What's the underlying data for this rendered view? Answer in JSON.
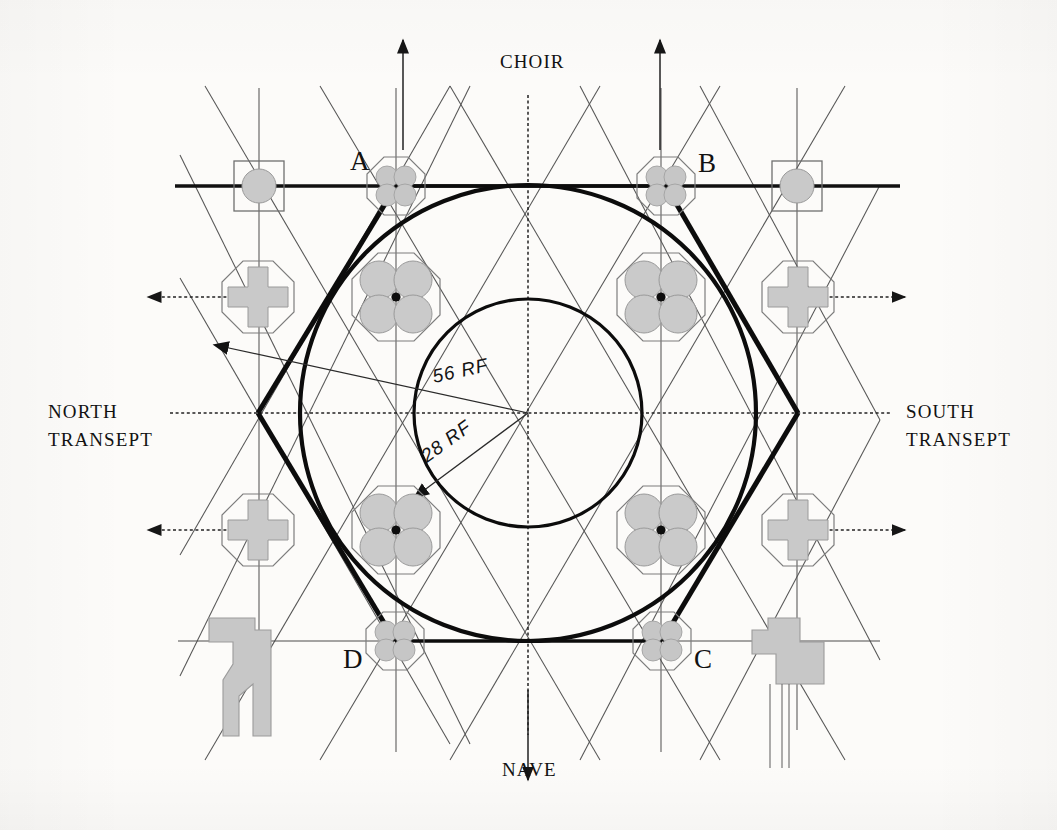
{
  "figure": {
    "type": "architectural-plan"
  },
  "cardinal_labels": {
    "top": "CHOIR",
    "bottom": "NAVE",
    "left_line1": "NORTH",
    "left_line2": "TRANSEPT",
    "right_line1": "SOUTH",
    "right_line2": "TRANSEPT"
  },
  "pier_labels": {
    "a": "A",
    "b": "B",
    "c": "C",
    "d": "D"
  },
  "dimensions": [
    {
      "id": "outer-radius",
      "text": "56 RF",
      "value": 56,
      "unit": "RF"
    },
    {
      "id": "inner-radius",
      "text": "28 RF",
      "value": 28,
      "unit": "RF"
    }
  ],
  "colors": {
    "ink": "#121212",
    "thin_line": "#3a3a3a",
    "grid_line": "#4a4a4a",
    "masonry_fill": "#c9c9c9",
    "masonry_stroke": "#7d7d7d",
    "paper": "#fcfbf9"
  },
  "geometry": {
    "center": {
      "x": 528,
      "y": 413
    },
    "outer_circle_radius": 228,
    "inner_circle_radius": 114,
    "octagon_vertices": [
      {
        "name": "A",
        "x": 396,
        "y": 186
      },
      {
        "name": "B",
        "x": 666,
        "y": 186
      },
      {
        "name": "SOUTH",
        "x": 798,
        "y": 413
      },
      {
        "name": "C",
        "x": 662,
        "y": 641
      },
      {
        "name": "D",
        "x": 395,
        "y": 641
      },
      {
        "name": "NORTH",
        "x": 258,
        "y": 413
      }
    ],
    "quatrefoil_piers": [
      {
        "x": 396,
        "y": 297
      },
      {
        "x": 661,
        "y": 297
      },
      {
        "x": 396,
        "y": 530
      },
      {
        "x": 661,
        "y": 530
      }
    ],
    "cruciform_piers": [
      {
        "x": 258,
        "y": 297
      },
      {
        "x": 798,
        "y": 297
      },
      {
        "x": 258,
        "y": 530
      },
      {
        "x": 798,
        "y": 530
      }
    ],
    "square_piers": [
      {
        "x": 259,
        "y": 186
      },
      {
        "x": 797,
        "y": 186
      }
    ],
    "wall_fragments": [
      {
        "x": 233,
        "y": 640,
        "mirrored": false
      },
      {
        "x": 790,
        "y": 640,
        "mirrored": true
      }
    ]
  }
}
